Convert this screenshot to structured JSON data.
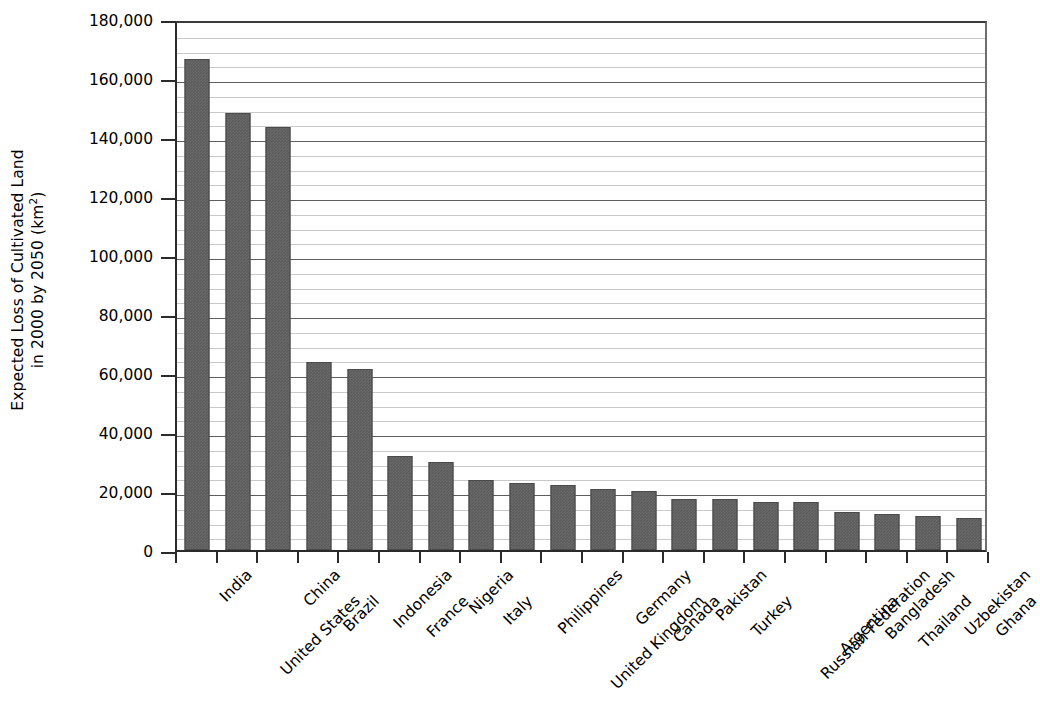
{
  "chart_data": {
    "type": "bar",
    "title": "",
    "subtitle": "",
    "xlabel": "",
    "ylabel": "Expected Loss of Cultivated Land in 2000 by 2050 (km2)",
    "ylabel_line1": "Expected Loss of Cultivated Land",
    "ylabel_line2_prefix": "in 2000 by 2050 (km",
    "ylabel_line2_sup": "2",
    "ylabel_line2_suffix": ")",
    "ylim": [
      0,
      180000
    ],
    "ytick_interval": 20000,
    "minor_gridline_interval": 5000,
    "grid": true,
    "legend": false,
    "bar_color": "#5b5b5b",
    "gridline_color": "#c9c9c9",
    "axis_color": "#2b2b2b",
    "ytick_labels": [
      "0",
      "20,000",
      "40,000",
      "60,000",
      "80,000",
      "100,000",
      "120,000",
      "140,000",
      "160,000",
      "180,000"
    ],
    "ytick_values": [
      0,
      20000,
      40000,
      60000,
      80000,
      100000,
      120000,
      140000,
      160000,
      180000
    ],
    "categories": [
      "India",
      "United States",
      "China",
      "Brazil",
      "Indonesia",
      "France",
      "Nigeria",
      "Italy",
      "Philippines",
      "United Kingdom",
      "Germany",
      "Canada",
      "Pakistan",
      "Turkey",
      "Russian Federation",
      "Argentina",
      "Bangladesh",
      "Thailand",
      "Uzbekistan",
      "Ghana"
    ],
    "values": [
      166500,
      148000,
      143500,
      63800,
      61500,
      31800,
      29800,
      23900,
      22600,
      22000,
      20800,
      19900,
      17400,
      17400,
      16200,
      16200,
      12800,
      12200,
      11500,
      11000
    ]
  }
}
